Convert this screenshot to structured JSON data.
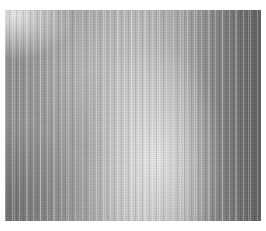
{
  "image": {
    "subject": "grayscale vertically striped texture",
    "background_color": "#ffffff",
    "texture_region": {
      "x": 5,
      "y": 10,
      "width": 256,
      "height": 211
    },
    "tones": {
      "base": "#9a9a9a",
      "highlight": "#e8e8e8",
      "shadow": "#5a5a5a"
    }
  }
}
